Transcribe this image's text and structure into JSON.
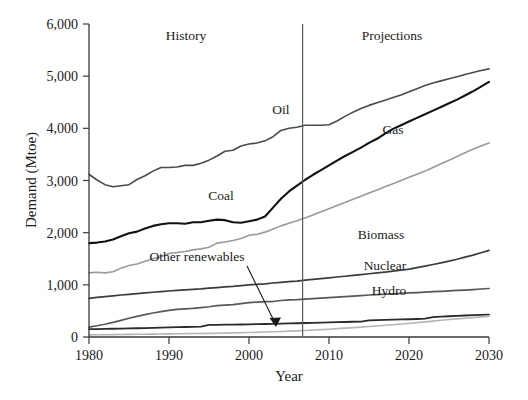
{
  "chart_data": {
    "type": "line",
    "title": "",
    "xlabel": "Year",
    "ylabel": "Demand (Mtoe)",
    "xlim": [
      1980,
      2030
    ],
    "ylim": [
      0,
      6000
    ],
    "xticks": [
      1980,
      1990,
      2000,
      2010,
      2020,
      2030
    ],
    "xtick_labels": [
      "1980",
      "1990",
      "2000",
      "2010",
      "2020",
      "2030"
    ],
    "yticks": [
      0,
      1000,
      2000,
      3000,
      4000,
      5000,
      6000
    ],
    "ytick_labels": [
      "0",
      "1,000",
      "2,000",
      "3,000",
      "4,000",
      "5,000",
      "6,000"
    ],
    "grid": false,
    "legend_position": "inline-labels",
    "annotations": [
      {
        "text": "History",
        "x": 1993,
        "y": 5670
      },
      {
        "text": "Projections",
        "x": 2015,
        "y": 5670
      },
      {
        "text": "Other renewables",
        "x": 1993.5,
        "y": 1460,
        "arrow_to_x": 2006,
        "arrow_to_y": 200
      }
    ],
    "divider": {
      "label": "history-projection-divider",
      "x": 2006.7
    },
    "x": [
      1980,
      1981,
      1982,
      1983,
      1984,
      1985,
      1986,
      1987,
      1988,
      1989,
      1990,
      1991,
      1992,
      1993,
      1994,
      1995,
      1996,
      1997,
      1998,
      1999,
      2000,
      2001,
      2002,
      2003,
      2004,
      2005,
      2006,
      2007,
      2008,
      2009,
      2010,
      2011,
      2012,
      2013,
      2014,
      2015,
      2016,
      2017,
      2018,
      2019,
      2020,
      2021,
      2022,
      2023,
      2024,
      2025,
      2026,
      2027,
      2028,
      2029,
      2030
    ],
    "series": [
      {
        "name": "Oil",
        "label_x": 2004,
        "label_y": 4270,
        "color": "#4a4a4a",
        "width": 1.6,
        "values": [
          3120,
          3010,
          2920,
          2880,
          2900,
          2920,
          3020,
          3090,
          3180,
          3250,
          3250,
          3260,
          3290,
          3290,
          3330,
          3390,
          3470,
          3560,
          3580,
          3660,
          3700,
          3720,
          3760,
          3840,
          3960,
          4000,
          4020,
          4060,
          4060,
          4060,
          4070,
          4140,
          4230,
          4310,
          4380,
          4440,
          4490,
          4540,
          4590,
          4640,
          4700,
          4760,
          4820,
          4870,
          4910,
          4950,
          4990,
          5030,
          5070,
          5110,
          5140
        ]
      },
      {
        "name": "Coal",
        "label_x": 1996.5,
        "label_y": 2620,
        "color": "#111111",
        "width": 2.1,
        "values": [
          1800,
          1810,
          1830,
          1870,
          1930,
          1990,
          2020,
          2080,
          2130,
          2160,
          2180,
          2180,
          2170,
          2200,
          2200,
          2230,
          2250,
          2240,
          2200,
          2190,
          2220,
          2250,
          2310,
          2480,
          2650,
          2790,
          2900,
          3010,
          3110,
          3200,
          3290,
          3380,
          3470,
          3550,
          3630,
          3720,
          3800,
          3900,
          3990,
          4060,
          4130,
          4200,
          4270,
          4340,
          4410,
          4480,
          4550,
          4630,
          4710,
          4800,
          4890
        ]
      },
      {
        "name": "Gas",
        "label_x": 2018,
        "label_y": 3900,
        "color": "#999999",
        "width": 1.6,
        "values": [
          1230,
          1240,
          1230,
          1250,
          1320,
          1370,
          1400,
          1450,
          1500,
          1540,
          1600,
          1620,
          1640,
          1670,
          1690,
          1720,
          1800,
          1820,
          1850,
          1890,
          1950,
          1970,
          2010,
          2070,
          2130,
          2180,
          2230,
          2280,
          2340,
          2400,
          2460,
          2520,
          2580,
          2640,
          2700,
          2760,
          2820,
          2880,
          2940,
          3000,
          3060,
          3120,
          3180,
          3250,
          3320,
          3390,
          3460,
          3530,
          3600,
          3660,
          3720
        ]
      },
      {
        "name": "Biomass",
        "label_x": 2016.5,
        "label_y": 1880,
        "color": "#3c3c3c",
        "width": 1.7,
        "values": [
          740,
          760,
          775,
          790,
          805,
          818,
          832,
          845,
          858,
          870,
          882,
          893,
          903,
          913,
          922,
          935,
          948,
          960,
          970,
          985,
          998,
          1010,
          1020,
          1035,
          1048,
          1060,
          1072,
          1090,
          1105,
          1120,
          1135,
          1150,
          1165,
          1180,
          1195,
          1212,
          1228,
          1245,
          1262,
          1280,
          1300,
          1330,
          1360,
          1390,
          1420,
          1455,
          1490,
          1530,
          1570,
          1615,
          1660
        ]
      },
      {
        "name": "Nuclear",
        "label_x": 2017,
        "label_y": 1280,
        "color": "#585858",
        "width": 1.7,
        "values": [
          190,
          215,
          245,
          280,
          320,
          360,
          395,
          430,
          460,
          485,
          510,
          530,
          540,
          550,
          565,
          580,
          600,
          610,
          620,
          640,
          660,
          670,
          680,
          680,
          700,
          710,
          715,
          725,
          735,
          745,
          755,
          765,
          775,
          785,
          795,
          805,
          812,
          820,
          828,
          836,
          844,
          852,
          860,
          868,
          876,
          884,
          892,
          900,
          910,
          920,
          930
        ]
      },
      {
        "name": "Hydro",
        "label_x": 2017.5,
        "label_y": 800,
        "color": "#2b2b2b",
        "width": 1.8,
        "values": [
          150,
          152,
          156,
          158,
          162,
          165,
          168,
          172,
          176,
          180,
          184,
          188,
          192,
          196,
          200,
          232,
          234,
          236,
          238,
          240,
          243,
          246,
          249,
          252,
          256,
          260,
          264,
          268,
          272,
          276,
          280,
          284,
          288,
          292,
          296,
          320,
          324,
          328,
          332,
          336,
          340,
          345,
          352,
          380,
          390,
          398,
          405,
          412,
          418,
          424,
          430
        ]
      },
      {
        "name": "Other renewables",
        "label_x": 1993.5,
        "label_y": 1460,
        "color": "#b5b5b5",
        "width": 1.6,
        "values": [
          40,
          42,
          44,
          46,
          48,
          50,
          52,
          54,
          56,
          58,
          60,
          62,
          64,
          66,
          68,
          70,
          73,
          76,
          79,
          82,
          85,
          90,
          95,
          100,
          106,
          112,
          118,
          126,
          134,
          142,
          150,
          160,
          170,
          180,
          190,
          200,
          212,
          224,
          236,
          248,
          260,
          275,
          290,
          305,
          320,
          335,
          348,
          360,
          372,
          386,
          400
        ]
      }
    ]
  }
}
